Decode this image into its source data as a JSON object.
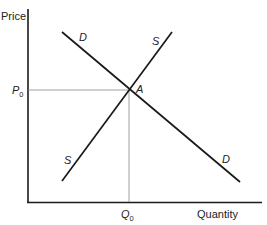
{
  "diagram": {
    "type": "supply-demand",
    "axes": {
      "y_label": "Price",
      "x_label": "Quantity"
    },
    "curves": {
      "demand": {
        "label": "D",
        "label_lower": "D"
      },
      "supply": {
        "label": "S",
        "label_lower": "S"
      }
    },
    "equilibrium": {
      "point_label": "A",
      "price_label": "P",
      "price_sub": "0",
      "quantity_label": "Q",
      "quantity_sub": "0"
    },
    "colors": {
      "line": "#1a1a1a",
      "guide": "#888888",
      "text": "#222222"
    }
  }
}
